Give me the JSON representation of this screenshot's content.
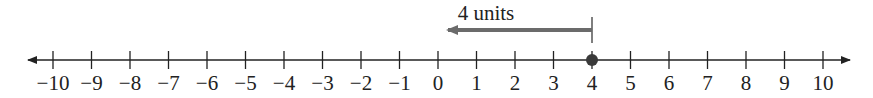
{
  "diagram": {
    "type": "number-line",
    "min": -10,
    "max": 10,
    "ticks": [
      "−10",
      "−9",
      "−8",
      "−7",
      "−6",
      "−5",
      "−4",
      "−3",
      "−2",
      "−1",
      "0",
      "1",
      "2",
      "3",
      "4",
      "5",
      "6",
      "7",
      "8",
      "9",
      "10"
    ],
    "highlighted_point": 4,
    "distance_arrow": {
      "from": 4,
      "to": 0,
      "label": "4 units"
    },
    "colors": {
      "axis": "#222222",
      "arrow": "#6b6b6b",
      "point": "#3a3a3a"
    }
  }
}
